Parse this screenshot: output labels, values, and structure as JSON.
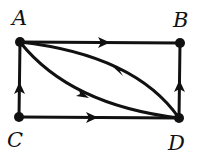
{
  "diagram": {
    "type": "directed-graph",
    "stroke_color": "#111111",
    "nodes": [
      {
        "id": "A",
        "label": "A",
        "x": 20,
        "y": 42
      },
      {
        "id": "B",
        "label": "B",
        "x": 180,
        "y": 43
      },
      {
        "id": "C",
        "label": "C",
        "x": 19,
        "y": 117
      },
      {
        "id": "D",
        "label": "D",
        "x": 179,
        "y": 118
      }
    ],
    "edges": [
      {
        "from": "A",
        "to": "B",
        "shape": "straight"
      },
      {
        "from": "C",
        "to": "A",
        "shape": "straight"
      },
      {
        "from": "D",
        "to": "B",
        "shape": "straight"
      },
      {
        "from": "C",
        "to": "D",
        "shape": "straight"
      },
      {
        "from": "A",
        "to": "D",
        "shape": "curve-lower"
      },
      {
        "from": "D",
        "to": "A",
        "shape": "curve-upper"
      }
    ]
  }
}
